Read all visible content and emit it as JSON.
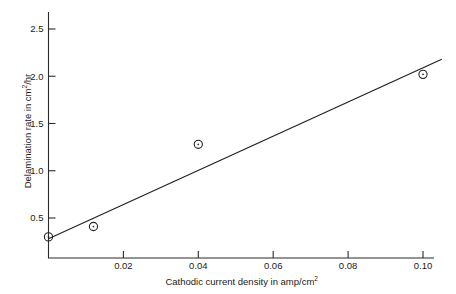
{
  "chart_data": {
    "type": "scatter",
    "title": "",
    "subtitle": "",
    "xlabel_text": "Cathodic current density in amp/cm",
    "xlabel_sup": "2",
    "ylabel_text": "Delamination rate in cm",
    "ylabel_sup": "2",
    "ylabel_tail": "/hr",
    "xlim": [
      0,
      0.105
    ],
    "ylim": [
      0,
      2.72
    ],
    "grid": false,
    "legend": "none",
    "xticks": [
      0.02,
      0.04,
      0.06,
      0.08,
      0.1
    ],
    "xtick_labels": [
      "0.02",
      "0.04",
      "0.06",
      "0.08",
      "0.10"
    ],
    "yticks": [
      0.5,
      1.0,
      1.5,
      2.0,
      2.5
    ],
    "ytick_labels": [
      "0.5",
      "1.0",
      "1.5",
      "2.0",
      "2.5"
    ],
    "series": [
      {
        "name": "measured points",
        "marker": "open-circle",
        "points": [
          {
            "x": 0.0,
            "y": 0.3
          },
          {
            "x": 0.012,
            "y": 0.41
          },
          {
            "x": 0.04,
            "y": 1.28
          },
          {
            "x": 0.1,
            "y": 2.02
          }
        ]
      },
      {
        "name": "fitted line",
        "marker": "none",
        "points": [
          {
            "x": 0.0,
            "y": 0.28
          },
          {
            "x": 0.105,
            "y": 2.18
          }
        ]
      }
    ]
  }
}
